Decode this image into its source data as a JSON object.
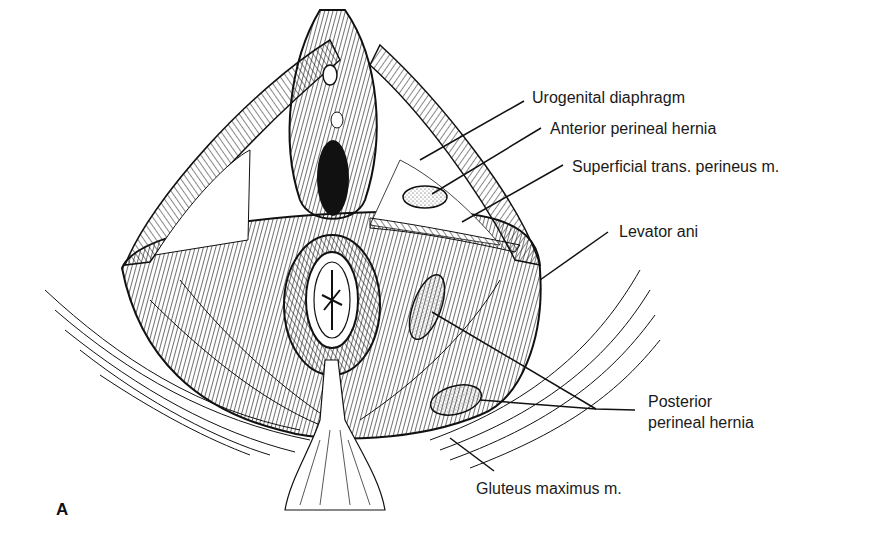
{
  "figure": {
    "panel_letter": "A",
    "labels": {
      "urogenital_diaphragm": "Urogenital diaphragm",
      "anterior_perineal_hernia": "Anterior perineal hernia",
      "superficial_trans_perineus": "Superficial trans. perineus m.",
      "levator_ani": "Levator ani",
      "posterior_perineal_hernia_line1": "Posterior",
      "posterior_perineal_hernia_line2": "perineal hernia",
      "gluteus_maximus": "Gluteus maximus m."
    },
    "colors": {
      "ink": "#111111",
      "background": "#ffffff"
    }
  }
}
